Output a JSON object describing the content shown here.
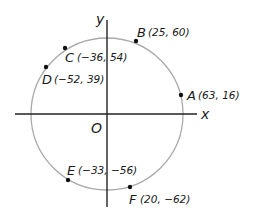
{
  "diagram": {
    "type": "circle-on-coordinate-plane",
    "axes": {
      "x_label": "x",
      "y_label": "y",
      "origin_label": "O",
      "color": "#222222"
    },
    "circle": {
      "center": [
        0,
        0
      ],
      "radius_units": 65,
      "color": "#aaaaaa"
    },
    "points": [
      {
        "name": "A",
        "coords": "(63, 16)",
        "x": 63,
        "y": 16
      },
      {
        "name": "B",
        "coords": "(25, 60)",
        "x": 25,
        "y": 60
      },
      {
        "name": "C",
        "coords": "(−36, 54)",
        "x": -36,
        "y": 54
      },
      {
        "name": "D",
        "coords": "(−52, 39)",
        "x": -52,
        "y": 39
      },
      {
        "name": "E",
        "coords": "(−33, −56)",
        "x": -33,
        "y": -56
      },
      {
        "name": "F",
        "coords": "(20, −62)",
        "x": 20,
        "y": -62
      }
    ]
  }
}
